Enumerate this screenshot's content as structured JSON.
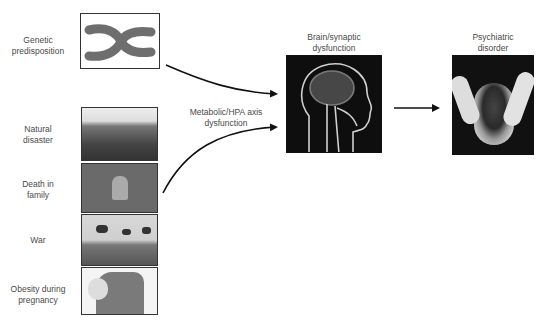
{
  "diagram": {
    "risk_factors": [
      {
        "id": "genetic",
        "label_line1": "Genetic",
        "label_line2": "predisposition",
        "image": "chromosome-icon"
      },
      {
        "id": "natural-disaster",
        "label_line1": "Natural",
        "label_line2": "disaster",
        "image": "disaster-photo"
      },
      {
        "id": "death",
        "label_line1": "Death in",
        "label_line2": "family",
        "image": "gravestone-photo"
      },
      {
        "id": "war",
        "label_line1": "War",
        "label_line2": "",
        "image": "helicopters-photo"
      },
      {
        "id": "obesity",
        "label_line1": "Obesity during",
        "label_line2": "pregnancy",
        "image": "pregnant-belly-photo"
      }
    ],
    "mediator": {
      "label_line1": "Metabolic/HPA axis",
      "label_line2": "dysfunction"
    },
    "brain": {
      "label_line1": "Brain/synaptic",
      "label_line2": "dysfunction",
      "image": "brain-xray-icon"
    },
    "outcome": {
      "label_line1": "Psychiatric",
      "label_line2": "disorder",
      "image": "distressed-person-photo"
    }
  },
  "colors": {
    "arrow": "#111111",
    "border": "#333333",
    "text": "#4a4a4a"
  }
}
